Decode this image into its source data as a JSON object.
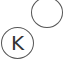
{
  "nodes": [
    {
      "id": "empty",
      "label": ""
    },
    {
      "id": "k",
      "label": "K"
    }
  ],
  "colors": {
    "stroke": "#555555",
    "text": "#333333",
    "background": "#ffffff"
  }
}
